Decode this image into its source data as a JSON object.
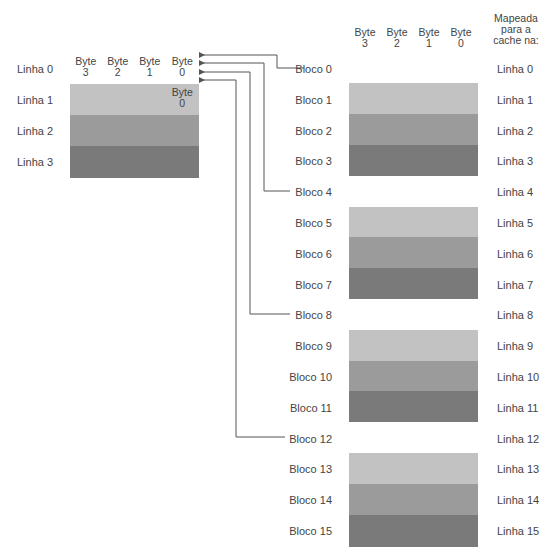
{
  "cache": {
    "rows": [
      {
        "label": "Linha 0",
        "cells": [
          "Byte\n3",
          "Byte\n2",
          "Byte\n1",
          "Byte\n0"
        ],
        "color": "#ffffff"
      },
      {
        "label": "Linha 1",
        "cells": [
          "",
          "",
          "",
          "Byte\n0"
        ],
        "color": "#c2c2c2"
      },
      {
        "label": "Linha 2",
        "cells": [
          "",
          "",
          "",
          ""
        ],
        "color": "#9b9b9b"
      },
      {
        "label": "Linha 3",
        "cells": [
          "",
          "",
          "",
          ""
        ],
        "color": "#7a7a7a"
      }
    ]
  },
  "memory": {
    "headers": [
      "Byte\n3",
      "Byte\n2",
      "Byte\n1",
      "Byte\n0"
    ],
    "mapped_header": "Mapeada\npara a\ncache na:",
    "blocks": [
      {
        "label": "Bloco 0",
        "mapped": "Linha 0"
      },
      {
        "label": "Bloco 1",
        "mapped": "Linha 1"
      },
      {
        "label": "Bloco 2",
        "mapped": "Linha 2"
      },
      {
        "label": "Bloco 3",
        "mapped": "Linha 3"
      },
      {
        "label": "Bloco 4",
        "mapped": "Linha 4"
      },
      {
        "label": "Bloco 5",
        "mapped": "Linha 5"
      },
      {
        "label": "Bloco 6",
        "mapped": "Linha 6"
      },
      {
        "label": "Bloco 7",
        "mapped": "Linha 7"
      },
      {
        "label": "Bloco 8",
        "mapped": "Linha 8"
      },
      {
        "label": "Bloco 9",
        "mapped": "Linha 9"
      },
      {
        "label": "Bloco 10",
        "mapped": "Linha 10"
      },
      {
        "label": "Bloco 11",
        "mapped": "Linha 11"
      },
      {
        "label": "Bloco 12",
        "mapped": "Linha 12"
      },
      {
        "label": "Bloco 13",
        "mapped": "Linha 13"
      },
      {
        "label": "Bloco 14",
        "mapped": "Linha 14"
      },
      {
        "label": "Bloco 15",
        "mapped": "Linha 15"
      }
    ],
    "shade_cycle": [
      "#ffffff",
      "#c2c2c2",
      "#9b9b9b",
      "#7a7a7a"
    ]
  },
  "connectors": [
    {
      "from": "Bloco 0",
      "to_cache_line": "Linha 0",
      "target_byte": "Byte 0"
    },
    {
      "from": "Bloco 4",
      "to_cache_line": "Linha 0",
      "target_byte": "Byte 0"
    },
    {
      "from": "Bloco 8",
      "to_cache_line": "Linha 0",
      "target_byte": "Byte 0"
    },
    {
      "from": "Bloco 12",
      "to_cache_line": "Linha 0",
      "target_byte": "Byte 0"
    }
  ],
  "colors": {
    "line": "#555555",
    "border": "#333333"
  }
}
